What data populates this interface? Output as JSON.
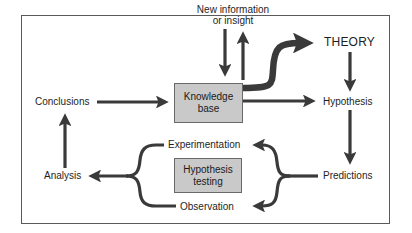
{
  "diagram": {
    "colors": {
      "arrow": "#3a3a3a",
      "box_fill": "#c9c9c9",
      "frame": "#5a5a5a",
      "text": "#1a1a1a"
    },
    "nodes": {
      "new_info": {
        "line1": "New information",
        "line2": "or insight"
      },
      "knowledge_base": {
        "line1": "Knowledge",
        "line2": "base"
      },
      "theory": {
        "label": "THEORY"
      },
      "hypothesis": {
        "label": "Hypothesis"
      },
      "predictions": {
        "label": "Predictions"
      },
      "conclusions": {
        "label": "Conclusions"
      },
      "analysis": {
        "label": "Analysis"
      },
      "experimentation": {
        "label": "Experimentation"
      },
      "observation": {
        "label": "Observation"
      },
      "hypothesis_testing": {
        "line1": "Hypothesis",
        "line2": "testing"
      }
    },
    "edges": [
      {
        "from": "New information or insight",
        "to": "Knowledge base"
      },
      {
        "from": "Knowledge base",
        "to": "New information or insight"
      },
      {
        "from": "Knowledge base",
        "to": "THEORY"
      },
      {
        "from": "Knowledge base",
        "to": "Hypothesis"
      },
      {
        "from": "THEORY",
        "to": "Hypothesis"
      },
      {
        "from": "Hypothesis",
        "to": "Predictions"
      },
      {
        "from": "Predictions",
        "to": "Experimentation"
      },
      {
        "from": "Predictions",
        "to": "Observation"
      },
      {
        "from": "Experimentation",
        "to": "Analysis"
      },
      {
        "from": "Observation",
        "to": "Analysis"
      },
      {
        "from": "Analysis",
        "to": "Conclusions"
      },
      {
        "from": "Conclusions",
        "to": "Knowledge base"
      }
    ]
  }
}
